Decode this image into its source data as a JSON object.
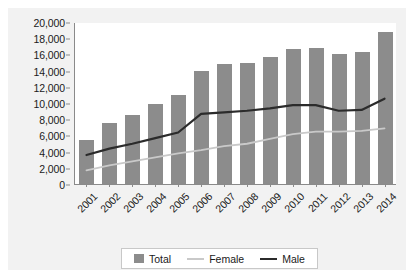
{
  "chart_data": {
    "type": "bar",
    "title": "",
    "subtitle": "",
    "xlabel": "",
    "ylabel": "",
    "categories": [
      "2001",
      "2002",
      "2003",
      "2004",
      "2005",
      "2006",
      "2007",
      "2008",
      "2009",
      "2010",
      "2011",
      "2012",
      "2013",
      "2014"
    ],
    "ylim": [
      0,
      20000
    ],
    "y_ticks": [
      0,
      2000,
      4000,
      6000,
      8000,
      10000,
      12000,
      14000,
      16000,
      18000,
      20000
    ],
    "y_tick_labels": [
      "0",
      "2,000",
      "4,000",
      "6,000",
      "8,000",
      "10,000",
      "12,000",
      "14,000",
      "16,000",
      "18,000",
      "20,000"
    ],
    "grid": false,
    "legend_position": "bottom",
    "series": [
      {
        "name": "Total",
        "render": "bar",
        "color": "#8c8c8c",
        "values": [
          5400,
          7500,
          8500,
          9900,
          11000,
          13900,
          14800,
          15000,
          15700,
          16700,
          16800,
          16100,
          16300,
          18800
        ]
      },
      {
        "name": "Female",
        "render": "line",
        "color": "#c9c9c9",
        "values": [
          1700,
          2300,
          2800,
          3300,
          3800,
          4200,
          4700,
          5000,
          5600,
          6200,
          6500,
          6500,
          6600,
          6900
        ]
      },
      {
        "name": "Male",
        "render": "line",
        "color": "#2b2b2b",
        "values": [
          3600,
          4400,
          5000,
          5700,
          6400,
          8700,
          8900,
          9100,
          9400,
          9800,
          9800,
          9100,
          9200,
          10600
        ]
      }
    ]
  },
  "legend": {
    "items": [
      {
        "label": "Total",
        "marker": "square-swatch"
      },
      {
        "label": "Female",
        "marker": "line-swatch"
      },
      {
        "label": "Male",
        "marker": "line-swatch"
      }
    ]
  }
}
